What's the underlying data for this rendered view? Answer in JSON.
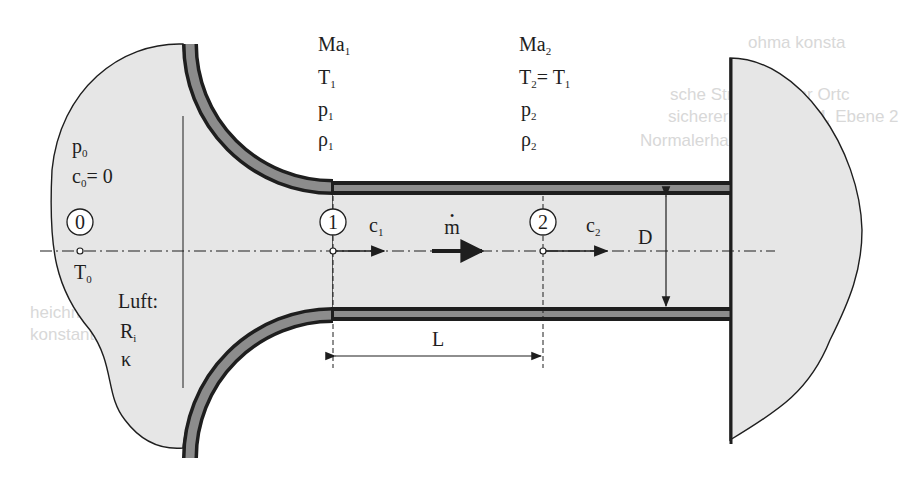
{
  "colors": {
    "background": "#ffffff",
    "fluid_region": "#e6e6e6",
    "wall_fill": "#8c8c8c",
    "wall_edge": "#1e1e1e",
    "ink": "#1e1e1e",
    "ghost_text": "#d8d8d8"
  },
  "state0": {
    "marker": "0",
    "pressure": {
      "base": "p",
      "sub": "0"
    },
    "velocity": {
      "base": "c",
      "sub": "0",
      "rest": "= 0"
    },
    "temperature": {
      "base": "T",
      "sub": "0"
    },
    "medium_label": "Luft:",
    "gas_constant": {
      "base": "R",
      "sub": "i"
    },
    "isentropic_exponent": "κ"
  },
  "state1": {
    "marker": "1",
    "mach": {
      "base": "Ma",
      "sub": "1"
    },
    "temperature": {
      "base": "T",
      "sub": "1"
    },
    "pressure": {
      "base": "p",
      "sub": "1"
    },
    "density": {
      "base": "ρ",
      "sub": "1"
    },
    "velocity": {
      "base": "c",
      "sub": "1"
    }
  },
  "state2": {
    "marker": "2",
    "mach": {
      "base": "Ma",
      "sub": "2"
    },
    "temperature": {
      "base": "T",
      "sub": "2",
      "rest": "= T",
      "rest_sub": "1"
    },
    "pressure": {
      "base": "p",
      "sub": "2"
    },
    "density": {
      "base": "ρ",
      "sub": "2"
    },
    "velocity": {
      "base": "c",
      "sub": "2"
    }
  },
  "mass_flow": {
    "symbol": "m",
    "dot": "•"
  },
  "dimensions": {
    "length": "L",
    "diameter": "D"
  },
  "ghost_text": {
    "lines": [
      "ohma konsta",
      "sche Strömung vor Ortc",
      "sicherer Strömung M, Ebene 2",
      "Normalerhaltungslinie",
      "heichrift",
      "konstante"
    ]
  }
}
